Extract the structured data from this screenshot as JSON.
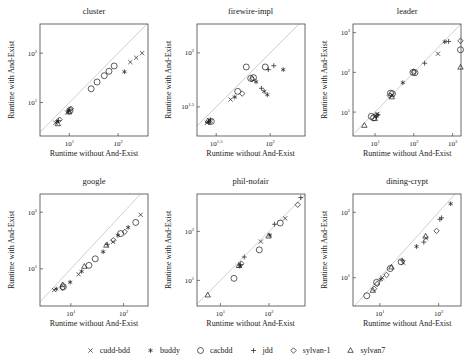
{
  "legend": {
    "items": [
      {
        "label": "cudd-bdd",
        "marker": "cross"
      },
      {
        "label": "buddy",
        "marker": "asterisk"
      },
      {
        "label": "cacbdd",
        "marker": "circle"
      },
      {
        "label": "jdd",
        "marker": "plus"
      },
      {
        "label": "sylvan-1",
        "marker": "diamond"
      },
      {
        "label": "sylvan7",
        "marker": "triangle"
      }
    ]
  },
  "style": {
    "marker_color": "#1a1a1a",
    "diagonal_color": "#c9c9c9",
    "box_color": "#444444"
  },
  "chart_data": [
    {
      "type": "scatter",
      "title": "cluster",
      "xlabel": "Runtime without And-Exist",
      "ylabel": "Runtime with And-Exist",
      "xlim": [
        2.5,
        410
      ],
      "ylim": [
        2.1,
        390
      ],
      "xticks": [
        "1",
        "2"
      ],
      "yticks": [
        "1",
        "2"
      ],
      "diagonal": true,
      "grid": false,
      "series": [
        {
          "name": "cudd-bdd",
          "marker": "cross",
          "points": [
            [
              5.2,
              3.9
            ],
            [
              9,
              6.3
            ],
            [
              178,
              66
            ],
            [
              235,
              81
            ],
            [
              310,
              100
            ]
          ]
        },
        {
          "name": "buddy",
          "marker": "asterisk",
          "points": [
            [
              5.6,
              4.1
            ],
            [
              9.6,
              6.7
            ],
            [
              135,
              42
            ]
          ]
        },
        {
          "name": "cacbdd",
          "marker": "circle",
          "points": [
            [
              10.3,
              6.9
            ],
            [
              28,
              19
            ],
            [
              37,
              26
            ],
            [
              52,
              35
            ],
            [
              65,
              43
            ],
            [
              83,
              55
            ]
          ]
        },
        {
          "name": "jdd",
          "marker": "plus",
          "points": [
            [
              6,
              4.3
            ],
            [
              10.2,
              7.1
            ]
          ]
        },
        {
          "name": "sylvan-1",
          "marker": "diamond",
          "points": [
            [
              6.3,
              4.5
            ],
            [
              10.7,
              7.5
            ]
          ]
        },
        {
          "name": "sylvan7",
          "marker": "triangle",
          "points": [
            [
              5.8,
              3.7
            ],
            [
              9.9,
              6.4
            ]
          ]
        }
      ]
    },
    {
      "type": "scatter",
      "title": "firewire-impl",
      "xlabel": "Runtime without And-Exist",
      "ylabel": "Runtime with And-Exist",
      "xlim": [
        21,
        210
      ],
      "ylim": [
        17,
        185
      ],
      "xticks": [
        "1.5",
        "2"
      ],
      "yticks": [
        "1.5",
        "2"
      ],
      "diagonal": true,
      "grid": false,
      "series": [
        {
          "name": "cudd-bdd",
          "marker": "cross",
          "points": [
            [
              26,
              22.5
            ],
            [
              43,
              37
            ]
          ]
        },
        {
          "name": "buddy",
          "marker": "asterisk",
          "points": [
            [
              27,
              23
            ],
            [
              47,
              39
            ],
            [
              74,
              54
            ],
            [
              88,
              44
            ],
            [
              94,
              41
            ],
            [
              132,
              70
            ]
          ]
        },
        {
          "name": "cacbdd",
          "marker": "circle",
          "points": [
            [
              28.5,
              23.2
            ],
            [
              50,
              44
            ],
            [
              66,
              58
            ],
            [
              70,
              59
            ],
            [
              60,
              74
            ],
            [
              90,
              74
            ]
          ]
        },
        {
          "name": "jdd",
          "marker": "plus",
          "points": [
            [
              28,
              24
            ],
            [
              83,
              47
            ],
            [
              96,
              70
            ],
            [
              108,
              76
            ]
          ]
        },
        {
          "name": "sylvan-1",
          "marker": "diamond",
          "points": [
            [
              27.5,
              22.8
            ],
            [
              55,
              42
            ],
            [
              68,
              57
            ]
          ]
        },
        {
          "name": "sylvan7",
          "marker": "triangle",
          "points": [
            [
              26.5,
              23.5
            ]
          ]
        }
      ]
    },
    {
      "type": "scatter",
      "title": "leader",
      "xlabel": "Runtime without And-Exist",
      "ylabel": "Runtime with And-Exist",
      "xlim": [
        2.7,
        1650
      ],
      "ylim": [
        2.5,
        1650
      ],
      "xticks": [
        "1",
        "2",
        "3"
      ],
      "yticks": [
        "1",
        "2",
        "3"
      ],
      "diagonal": true,
      "grid": false,
      "series": [
        {
          "name": "cudd-bdd",
          "marker": "cross",
          "points": [
            [
              11.5,
              9
            ],
            [
              28,
              27
            ],
            [
              420,
              295
            ]
          ]
        },
        {
          "name": "buddy",
          "marker": "asterisk",
          "points": [
            [
              10.8,
              7.8
            ],
            [
              52,
              55
            ],
            [
              630,
              590
            ]
          ]
        },
        {
          "name": "cacbdd",
          "marker": "circle",
          "points": [
            [
              8,
              7.8
            ],
            [
              9.2,
              7.2
            ],
            [
              25,
              30
            ],
            [
              28,
              29
            ],
            [
              95,
              100
            ],
            [
              107,
              98
            ],
            [
              1600,
              370
            ]
          ]
        },
        {
          "name": "jdd",
          "marker": "plus",
          "points": [
            [
              12,
              8.6
            ],
            [
              190,
              170
            ],
            [
              790,
              600
            ]
          ]
        },
        {
          "name": "sylvan-1",
          "marker": "diamond",
          "points": [
            [
              10.5,
              8.2
            ],
            [
              24,
              26
            ],
            [
              100,
              104
            ],
            [
              1600,
              620
            ]
          ]
        },
        {
          "name": "sylvan7",
          "marker": "triangle",
          "points": [
            [
              5.3,
              4.6
            ],
            [
              9.8,
              6.8
            ],
            [
              27,
              24
            ],
            [
              1600,
              134
            ]
          ]
        }
      ]
    },
    {
      "type": "scatter",
      "title": "google",
      "xlabel": "Runtime without And-Exist",
      "ylabel": "Runtime with And-Exist",
      "xlim": [
        2.6,
        290
      ],
      "ylim": [
        2.2,
        210
      ],
      "xticks": [
        "1",
        "2"
      ],
      "yticks": [
        "1",
        "2"
      ],
      "diagonal": true,
      "grid": false,
      "series": [
        {
          "name": "cudd-bdd",
          "marker": "cross",
          "points": [
            [
              4.8,
              4.2
            ],
            [
              14,
              8
            ],
            [
              63,
              30
            ],
            [
              210,
              90
            ]
          ]
        },
        {
          "name": "buddy",
          "marker": "asterisk",
          "points": [
            [
              5.3,
              4.4
            ],
            [
              9.7,
              5.8
            ],
            [
              16,
              9
            ],
            [
              41,
              20
            ],
            [
              78,
              39
            ],
            [
              122,
              54
            ]
          ]
        },
        {
          "name": "cacbdd",
          "marker": "circle",
          "points": [
            [
              7.2,
              4.8
            ],
            [
              22,
              11.5
            ],
            [
              29,
              15
            ],
            [
              88,
              42
            ],
            [
              170,
              66
            ]
          ]
        },
        {
          "name": "jdd",
          "marker": "plus",
          "points": [
            [
              49,
              27
            ]
          ]
        },
        {
          "name": "sylvan-1",
          "marker": "diamond",
          "points": [
            [
              6.9,
              4.6
            ],
            [
              64,
              32
            ],
            [
              105,
              45
            ]
          ]
        },
        {
          "name": "sylvan7",
          "marker": "triangle",
          "points": [
            [
              7,
              5.2
            ],
            [
              18,
              11
            ],
            [
              47,
              26
            ]
          ]
        }
      ]
    },
    {
      "type": "scatter",
      "title": "phil-nofair",
      "xlabel": "Runtime without And-Exist",
      "ylabel": "Runtime with And-Exist",
      "xlim": [
        3.3,
        550
      ],
      "ylim": [
        3,
        580
      ],
      "xticks": [
        "1",
        "2"
      ],
      "yticks": [
        "1",
        "2"
      ],
      "diagonal": true,
      "grid": false,
      "series": [
        {
          "name": "cudd-bdd",
          "marker": "cross",
          "points": [
            [
              68,
              62
            ],
            [
              215,
              185
            ]
          ]
        },
        {
          "name": "buddy",
          "marker": "asterisk",
          "points": [
            [
              25,
              19.5
            ],
            [
              104,
              84
            ]
          ]
        },
        {
          "name": "cacbdd",
          "marker": "circle",
          "points": [
            [
              19,
              11
            ],
            [
              63,
              42
            ],
            [
              170,
              148
            ]
          ]
        },
        {
          "name": "jdd",
          "marker": "plus",
          "points": [
            [
              26,
              21
            ],
            [
              31,
              30
            ],
            [
              130,
              140
            ],
            [
              450,
              490
            ]
          ]
        },
        {
          "name": "sylvan-1",
          "marker": "diamond",
          "points": [
            [
              27,
              22
            ],
            [
              390,
              350
            ]
          ]
        },
        {
          "name": "sylvan7",
          "marker": "triangle",
          "points": [
            [
              5.5,
              5
            ],
            [
              24,
              20
            ],
            [
              98,
              80
            ]
          ]
        }
      ]
    },
    {
      "type": "scatter",
      "title": "dining-crypt",
      "xlabel": "Runtime without And-Exist",
      "ylabel": "Runtime with And-Exist",
      "xlim": [
        3.5,
        240
      ],
      "ylim": [
        3.7,
        190
      ],
      "xticks": [
        "1",
        "2"
      ],
      "yticks": [
        "1",
        "2"
      ],
      "diagonal": true,
      "grid": false,
      "series": [
        {
          "name": "cudd-bdd",
          "marker": "cross",
          "points": [
            [
              11,
              10
            ],
            [
              25,
              17
            ],
            [
              61,
              40
            ]
          ]
        },
        {
          "name": "buddy",
          "marker": "asterisk",
          "points": [
            [
              10.4,
              9.4
            ],
            [
              42,
              30
            ],
            [
              160,
              135
            ]
          ]
        },
        {
          "name": "cacbdd",
          "marker": "circle",
          "points": [
            [
              6,
              5.3
            ],
            [
              8.8,
              8.5
            ],
            [
              15,
              13.8
            ],
            [
              23,
              17.5
            ]
          ]
        },
        {
          "name": "jdd",
          "marker": "plus",
          "points": [
            [
              24,
              18.5
            ],
            [
              56,
              35
            ],
            [
              105,
              78
            ],
            [
              112,
              82
            ]
          ]
        },
        {
          "name": "sylvan-1",
          "marker": "diamond",
          "points": [
            [
              8,
              6.8
            ],
            [
              9,
              8
            ],
            [
              13,
              11
            ],
            [
              92,
              52
            ]
          ]
        },
        {
          "name": "sylvan7",
          "marker": "triangle",
          "points": [
            [
              7.6,
              6.4
            ],
            [
              15.8,
              14.5
            ],
            [
              60,
              43
            ]
          ]
        }
      ]
    }
  ]
}
